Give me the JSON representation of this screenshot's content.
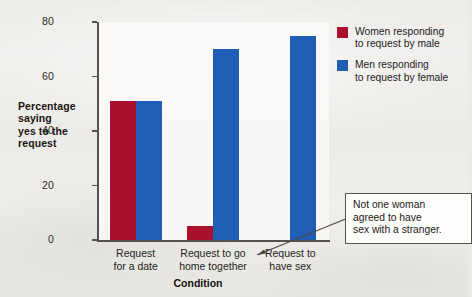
{
  "chart_data": {
    "type": "bar",
    "title": "",
    "xlabel": "Condition",
    "ylabel": "Percentage saying yes to the request",
    "ylim": [
      0,
      80
    ],
    "yticks": [
      0,
      20,
      40,
      60,
      80
    ],
    "grid": false,
    "legend_position": "top-right",
    "categories": [
      "Request for a date",
      "Request to go home together",
      "Request to have sex"
    ],
    "category_lines": [
      [
        "Request",
        "for a date"
      ],
      [
        "Request to go",
        "home together"
      ],
      [
        "Request to",
        "have sex"
      ]
    ],
    "series": [
      {
        "name": "Women responding to request by male",
        "name_lines": [
          "Women responding",
          "to request by male"
        ],
        "color": "#a8102e",
        "values": [
          51,
          5,
          0
        ]
      },
      {
        "name": "Men responding to request by female",
        "name_lines": [
          "Men responding",
          "to request by female"
        ],
        "color": "#1f5eb4",
        "values": [
          51,
          70,
          75
        ]
      }
    ],
    "annotations": [
      {
        "text": "Not one woman agreed to have sex with a stranger.",
        "lines": [
          "Not one woman",
          "agreed to have",
          "sex with a stranger."
        ],
        "points_to": "Request to have sex / women series (value 0)"
      }
    ]
  },
  "axis": {
    "y_title_lines": [
      "Percentage",
      "saying",
      "yes to the",
      "request"
    ],
    "tick_labels": [
      "80",
      "60",
      "40",
      "20",
      "0"
    ],
    "x_title": "Condition"
  },
  "colors": {
    "red": "#a8102e",
    "blue": "#1f5eb4",
    "axis": "#55514c",
    "paper": "#eceae6"
  }
}
